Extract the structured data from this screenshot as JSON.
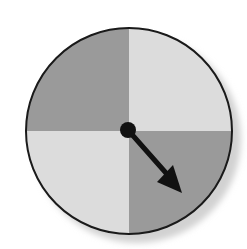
{
  "figure": {
    "type": "spinner",
    "sections": [
      {
        "name": "top-left",
        "shade": "dark",
        "color": "#9a9a9a"
      },
      {
        "name": "top-right",
        "shade": "light",
        "color": "#dcdcdc"
      },
      {
        "name": "bottom-right",
        "shade": "dark",
        "color": "#9a9a9a"
      },
      {
        "name": "bottom-left",
        "shade": "light",
        "color": "#dcdcdc"
      }
    ],
    "pointer": {
      "direction": "bottom-right",
      "color": "#111111"
    },
    "outline_color": "#1a1a1a",
    "shadow_color": "#d4d4d4"
  }
}
